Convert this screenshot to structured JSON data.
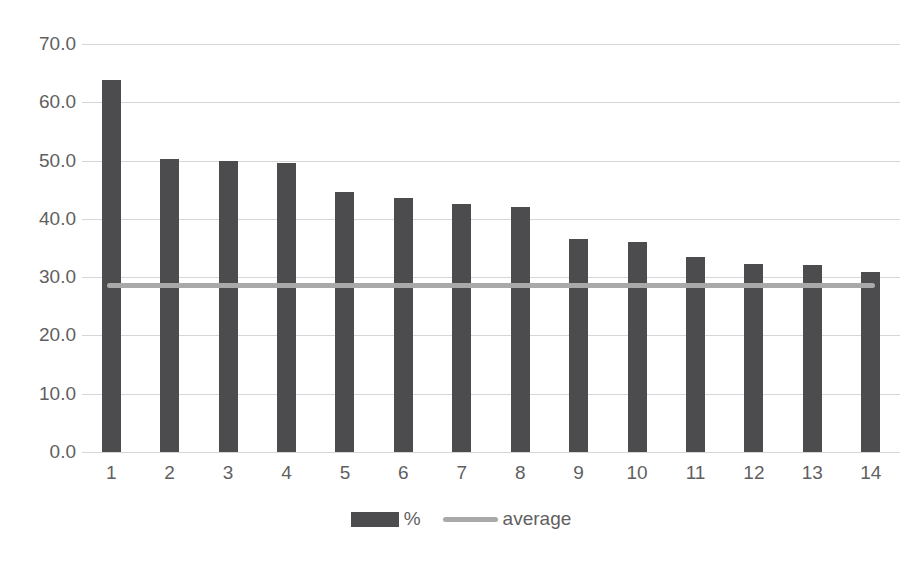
{
  "chart_data": {
    "type": "bar",
    "title": "",
    "xlabel": "",
    "ylabel": "",
    "categories": [
      "1",
      "2",
      "3",
      "4",
      "5",
      "6",
      "7",
      "8",
      "9",
      "10",
      "11",
      "12",
      "13",
      "14"
    ],
    "series": [
      {
        "name": "%",
        "type": "bar",
        "color": "#4c4c4e",
        "values": [
          63.8,
          50.3,
          50.0,
          49.5,
          44.6,
          43.5,
          42.6,
          42.0,
          36.6,
          36.0,
          33.5,
          32.2,
          32.0,
          30.8
        ]
      },
      {
        "name": "average",
        "type": "line",
        "color": "#a9a9a9",
        "value": 28.5
      }
    ],
    "ylim": [
      0,
      70
    ],
    "ytick_values": [
      0,
      10,
      20,
      30,
      40,
      50,
      60,
      70
    ],
    "ytick_labels": [
      "0.0",
      "10.0",
      "20.0",
      "30.0",
      "40.0",
      "50.0",
      "60.0",
      "70.0"
    ],
    "grid": true,
    "legend_position": "bottom"
  },
  "colors": {
    "bar": "#4c4c4e",
    "average_line": "#a9a9a9",
    "gridline": "#d6d6d6",
    "axis_text": "#5f5f5f",
    "background": "#ffffff"
  }
}
